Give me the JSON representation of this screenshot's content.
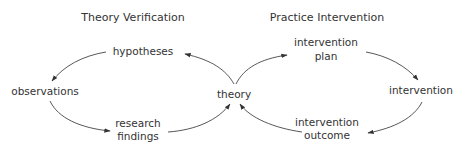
{
  "titles": {
    "left": "Theory Verification",
    "right": "Practice Intervention"
  },
  "nodes": {
    "hypotheses": [
      "hypotheses"
    ],
    "observations": [
      "observations"
    ],
    "research_findings": [
      "research",
      "findings"
    ],
    "theory": [
      "theory"
    ],
    "intervention_plan": [
      "intervention",
      "plan"
    ],
    "intervention": [
      "intervention"
    ],
    "intervention_outcome": [
      "intervention",
      "outcome"
    ]
  },
  "edges": [
    {
      "from": "theory",
      "to": "hypotheses"
    },
    {
      "from": "hypotheses",
      "to": "observations"
    },
    {
      "from": "observations",
      "to": "research findings"
    },
    {
      "from": "research findings",
      "to": "theory"
    },
    {
      "from": "theory",
      "to": "intervention plan"
    },
    {
      "from": "intervention plan",
      "to": "intervention"
    },
    {
      "from": "intervention",
      "to": "intervention outcome"
    },
    {
      "from": "intervention outcome",
      "to": "theory"
    }
  ]
}
